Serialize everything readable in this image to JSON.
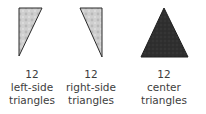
{
  "pieces": [
    {
      "count": "12",
      "line1": "left-side",
      "line2": "triangles",
      "shape": "left-side-triangle",
      "fill": "#c8c8c8",
      "points": "19,8 42,8 19,56"
    },
    {
      "count": "12",
      "line1": "right-side",
      "line2": "triangles",
      "shape": "right-side-triangle",
      "fill": "#c8c8c8",
      "points": "80,8 102,8 102,57"
    },
    {
      "count": "12",
      "line1": "center",
      "line2": "triangles",
      "shape": "center-triangle",
      "fill": "#2e2e2e",
      "points": "164,8 141,57 188,57"
    }
  ],
  "colors": {
    "outline": "#2a2a2a",
    "light_fabric": "#c8c8c8",
    "dark_fabric": "#2e2e2e"
  }
}
